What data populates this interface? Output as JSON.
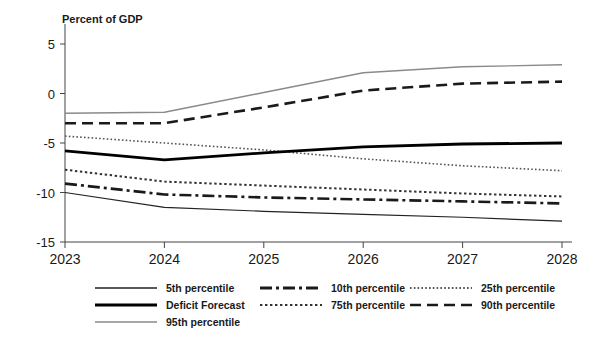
{
  "chart_data": {
    "type": "line",
    "title": "",
    "ylabel": "Percent of GDP",
    "xlabel": "",
    "x": [
      "2023",
      "2024",
      "2025",
      "2026",
      "2027",
      "2028"
    ],
    "ylim": [
      -15,
      5
    ],
    "yticks": [
      5,
      0,
      -5,
      -10,
      -15
    ],
    "ytick_labels": [
      "5",
      "0",
      "-5",
      "-10",
      "-15"
    ],
    "xtick_labels": [
      "2023",
      "2024",
      "2025",
      "2026",
      "2027",
      "2028"
    ],
    "grid": false,
    "legend_position": "bottom",
    "series": [
      {
        "name": "5th percentile",
        "values": [
          -10.0,
          -11.5,
          -11.9,
          -12.2,
          -12.5,
          -12.9
        ],
        "style": "solid",
        "color": "#222222",
        "width": 1.2
      },
      {
        "name": "10th percentile",
        "values": [
          -9.1,
          -10.2,
          -10.5,
          -10.7,
          -10.9,
          -11.1
        ],
        "style": "dashdot",
        "color": "#1a1a1a",
        "width": 2.6
      },
      {
        "name": "25th percentile",
        "values": [
          -4.3,
          -5.0,
          -5.7,
          -6.6,
          -7.3,
          -7.8
        ],
        "style": "dotted-fine",
        "color": "#555555",
        "width": 1.6
      },
      {
        "name": "Deficit Forecast",
        "values": [
          -5.8,
          -6.7,
          -6.0,
          -5.4,
          -5.1,
          -5.0
        ],
        "style": "solid",
        "color": "#000000",
        "width": 2.8
      },
      {
        "name": "75th percentile",
        "values": [
          -7.7,
          -8.9,
          -9.3,
          -9.7,
          -10.1,
          -10.4
        ],
        "style": "dotted-square",
        "color": "#333333",
        "width": 2.0
      },
      {
        "name": "90th percentile",
        "values": [
          -3.0,
          -3.0,
          -1.4,
          0.3,
          1.0,
          1.2
        ],
        "style": "dashed",
        "color": "#1a1a1a",
        "width": 2.6
      },
      {
        "name": "95th percentile",
        "values": [
          -2.0,
          -1.9,
          0.1,
          2.1,
          2.7,
          2.9
        ],
        "style": "solid",
        "color": "#8a8a8a",
        "width": 1.4
      }
    ]
  },
  "legend": {
    "entries": [
      {
        "label": "5th percentile",
        "style": "solid",
        "color": "#222222",
        "width": 1.4
      },
      {
        "label": "10th percentile",
        "style": "dashdot",
        "color": "#1a1a1a",
        "width": 2.8
      },
      {
        "label": "25th percentile",
        "style": "dotted-fine",
        "color": "#555555",
        "width": 1.8
      },
      {
        "label": "Deficit Forecast",
        "style": "solid",
        "color": "#000000",
        "width": 3.2
      },
      {
        "label": "75th percentile",
        "style": "dotted-square",
        "color": "#333333",
        "width": 2.0
      },
      {
        "label": "90th percentile",
        "style": "dashed",
        "color": "#1a1a1a",
        "width": 2.6
      },
      {
        "label": "95th percentile",
        "style": "solid",
        "color": "#8a8a8a",
        "width": 1.6
      }
    ]
  }
}
